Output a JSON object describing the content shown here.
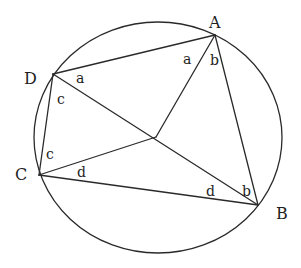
{
  "diagram": {
    "vertices": [
      {
        "id": "A",
        "label": "A"
      },
      {
        "id": "B",
        "label": "B"
      },
      {
        "id": "C",
        "label": "C"
      },
      {
        "id": "D",
        "label": "D"
      }
    ],
    "interior_point": {
      "id": "O",
      "label": ""
    },
    "edges": [
      {
        "from": "D",
        "to": "A"
      },
      {
        "from": "A",
        "to": "B"
      },
      {
        "from": "B",
        "to": "C"
      },
      {
        "from": "C",
        "to": "D"
      },
      {
        "from": "A",
        "to": "O"
      },
      {
        "from": "D",
        "to": "O"
      },
      {
        "from": "D",
        "to": "B"
      },
      {
        "from": "C",
        "to": "O"
      }
    ],
    "angle_labels": [
      {
        "id": "a-at-D",
        "text": "a",
        "vertex": "D"
      },
      {
        "id": "c-at-D",
        "text": "c",
        "vertex": "D"
      },
      {
        "id": "a-at-A",
        "text": "a",
        "vertex": "A"
      },
      {
        "id": "b-at-A",
        "text": "b",
        "vertex": "A"
      },
      {
        "id": "c-at-C",
        "text": "c",
        "vertex": "C"
      },
      {
        "id": "d-at-C",
        "text": "d",
        "vertex": "C"
      },
      {
        "id": "d-at-B",
        "text": "d",
        "vertex": "B"
      },
      {
        "id": "b-at-B",
        "text": "b",
        "vertex": "B"
      }
    ],
    "stroke_color": "#2a2a2a",
    "background_color": "#ffffff"
  }
}
